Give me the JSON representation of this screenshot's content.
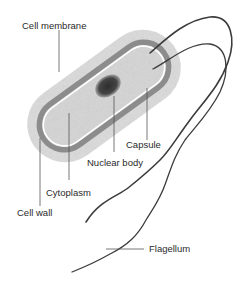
{
  "diagram": {
    "labels": {
      "cell_membrane": "Cell membrane",
      "capsule": "Capsule",
      "nuclear_body": "Nuclear body",
      "cytoplasm": "Cytoplasm",
      "cell_wall": "Cell wall",
      "flagellum": "Flagellum"
    },
    "colors": {
      "capsule_fill": "#d9d9d9",
      "wall_band": "#8a8a8a",
      "membrane_line": "#ffffff",
      "cytoplasm_fill": "#d2d2d2",
      "nuclear_body": "#3a3a3a",
      "flagellum_stroke": "#3c3c3c",
      "leader_line": "#555555",
      "text": "#2a2a2a"
    }
  }
}
